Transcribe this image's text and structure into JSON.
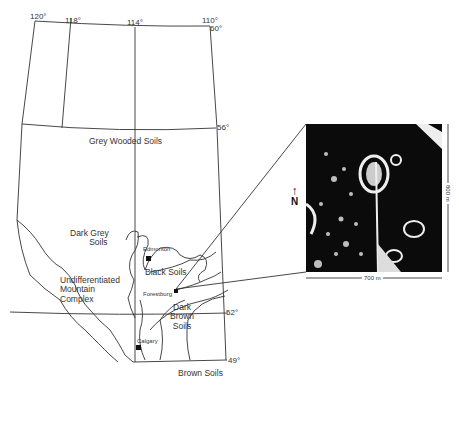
{
  "map": {
    "region": "Alberta",
    "longitude_labels": [
      "120°",
      "118°",
      "114°",
      "110°"
    ],
    "latitude_labels": [
      "60°",
      "56°",
      "52°",
      "49°"
    ],
    "soil_zones": [
      {
        "name": "Grey Wooded Soils"
      },
      {
        "name": "Dark Grey Soils",
        "lines": [
          "Dark Grey",
          "Soils"
        ]
      },
      {
        "name": "Black Soils"
      },
      {
        "name": "Undifferentiated Mountain Complex",
        "lines": [
          "Undifferentiated",
          "Mountain",
          "Complex"
        ]
      },
      {
        "name": "Dark Brown Soils",
        "lines": [
          "Dark",
          "Brown",
          "Soils"
        ]
      },
      {
        "name": "Brown Soils"
      }
    ],
    "cities": [
      {
        "name": "Edmonton"
      },
      {
        "name": "Forestburg"
      },
      {
        "name": "Calgary"
      }
    ]
  },
  "inset": {
    "north_label": "N",
    "width_label": "700 m",
    "height_label": "800 m"
  }
}
